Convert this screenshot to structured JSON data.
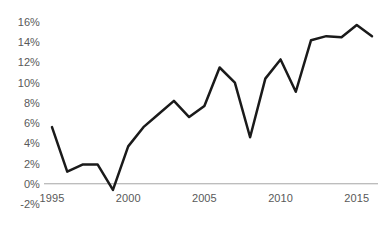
{
  "chart_data": {
    "type": "line",
    "title": "",
    "subtitle": "",
    "xlabel": "",
    "ylabel": "",
    "x": [
      1995,
      1996,
      1997,
      1998,
      1999,
      2000,
      2001,
      2002,
      2003,
      2004,
      2005,
      2006,
      2007,
      2008,
      2009,
      2010,
      2011,
      2012,
      2013,
      2014,
      2015,
      2016
    ],
    "values": [
      5.6,
      1.2,
      1.9,
      1.9,
      -0.6,
      3.7,
      5.6,
      6.9,
      8.2,
      6.6,
      7.7,
      11.5,
      10.0,
      4.6,
      10.4,
      12.3,
      9.1,
      14.2,
      14.6,
      14.5,
      15.7,
      14.6
    ],
    "series": [
      {
        "name": "",
        "values": [
          5.6,
          1.2,
          1.9,
          1.9,
          -0.6,
          3.7,
          5.6,
          6.9,
          8.2,
          6.6,
          7.7,
          11.5,
          10.0,
          4.6,
          10.4,
          12.3,
          9.1,
          14.2,
          14.6,
          14.5,
          15.7,
          14.6
        ]
      }
    ],
    "units": "%",
    "ylim": [
      -2,
      16
    ],
    "xlim": [
      1995,
      2016
    ],
    "ytick_values": [
      -2,
      0,
      2,
      4,
      6,
      8,
      10,
      12,
      14,
      16
    ],
    "ytick_labels": [
      "-2%",
      "0%",
      "2%",
      "4%",
      "6%",
      "8%",
      "10%",
      "12%",
      "14%",
      "16%"
    ],
    "xtick_values": [
      1995,
      2000,
      2005,
      2010,
      2015
    ],
    "xtick_labels": [
      "1995",
      "2000",
      "2005",
      "2010",
      "2015"
    ],
    "grid": false,
    "legend": false,
    "legend_position": "none",
    "zero_line": true,
    "annotations": []
  },
  "style": {
    "line_color": "#1a1a1a",
    "line_width": 2.5,
    "zero_line_color": "#a6a6a6",
    "tick_label_color": "#595959",
    "background_color": "#ffffff"
  }
}
